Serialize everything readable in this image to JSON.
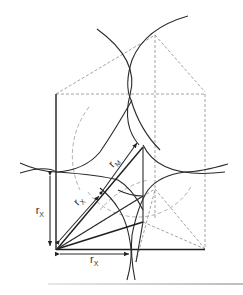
{
  "figure": {
    "type": "geometric-construction",
    "labels": {
      "rx_vertical": {
        "main": "r",
        "sub": "X"
      },
      "rx_diagonal": {
        "main": "r",
        "sub": "X"
      },
      "rx_horizontal": {
        "main": "r",
        "sub": "X"
      },
      "rm_diagonal": {
        "main": "r",
        "sub": "M"
      }
    }
  }
}
